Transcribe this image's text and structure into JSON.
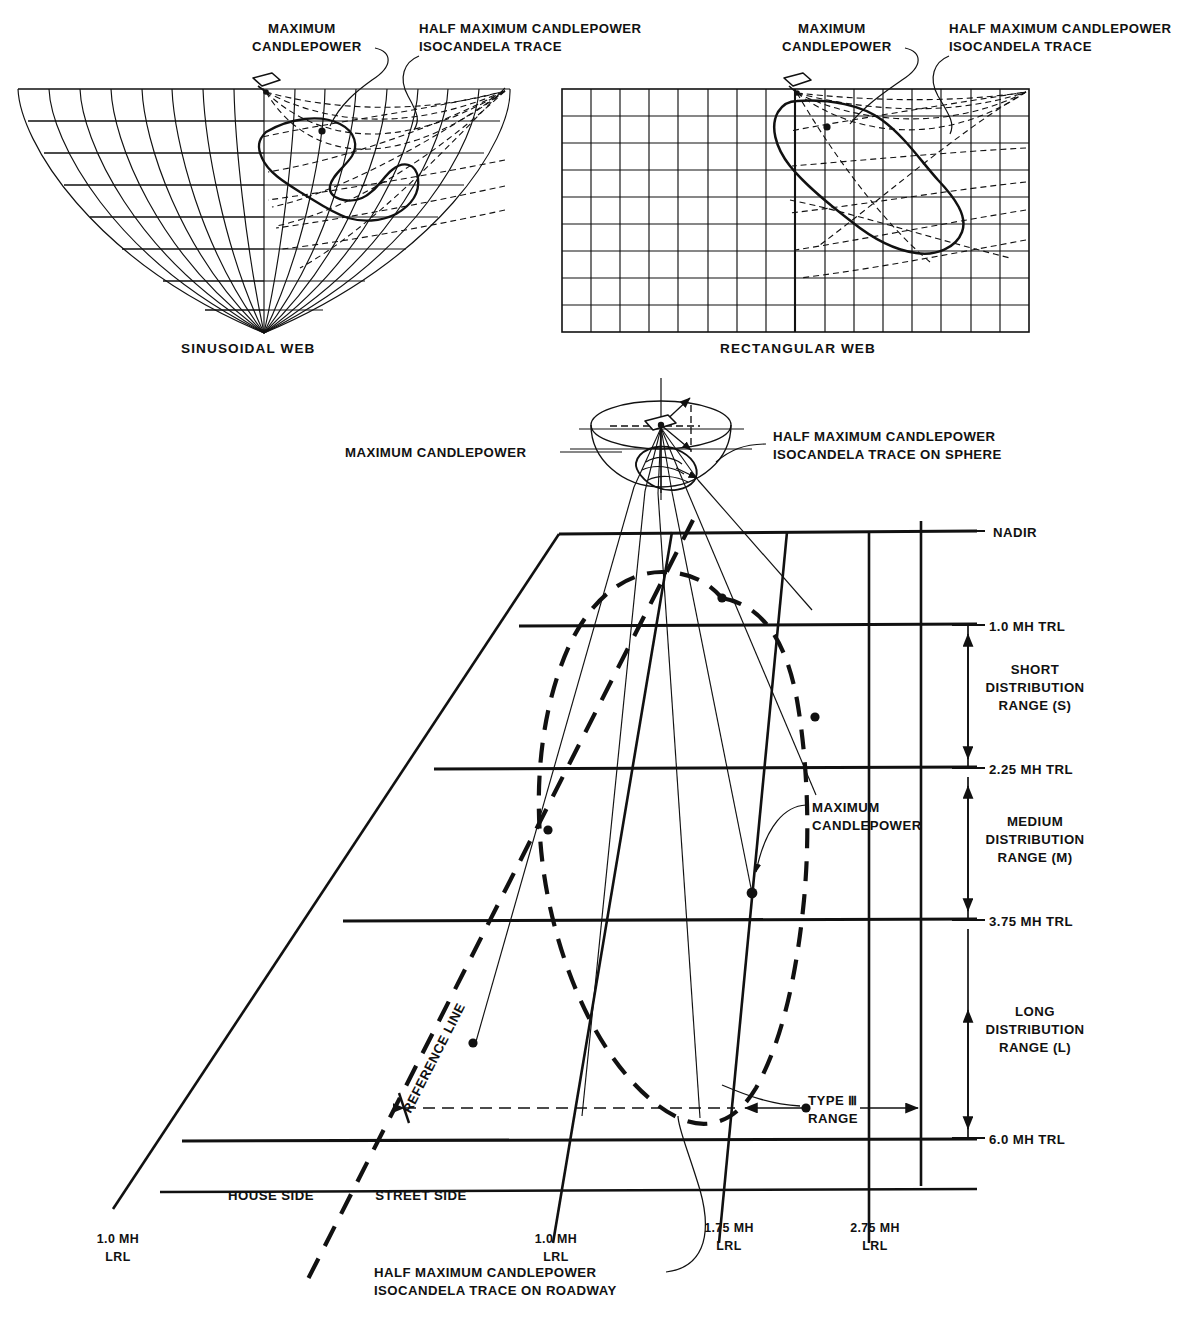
{
  "figure": {
    "title_top_left_web": "SINUSOIDAL WEB",
    "title_top_right_web": "RECTANGULAR WEB"
  },
  "callouts": {
    "max_cp_line1": "MAXIMUM",
    "max_cp_line2": "CANDLEPOWER",
    "half_max_line1": "HALF MAXIMUM CANDLEPOWER",
    "half_max_line2": "ISOCANDELA TRACE",
    "sphere_max_cp": "MAXIMUM CANDLEPOWER",
    "sphere_half_line1": "HALF MAXIMUM CANDLEPOWER",
    "sphere_half_line2": "ISOCANDELA TRACE ON SPHERE",
    "roadway_max_line1": "MAXIMUM",
    "roadway_max_line2": "CANDLEPOWER",
    "roadway_half_line1": "HALF MAXIMUM CANDLEPOWER",
    "roadway_half_line2": "ISOCANDELA TRACE ON ROADWAY",
    "reference_line": "REFERENCE LINE",
    "type_range_line1": "TYPE Ⅲ",
    "type_range_line2": "RANGE"
  },
  "trl_axis": {
    "nadir": "NADIR",
    "ticks": [
      {
        "label": "1.0 MH TRL",
        "value": 1.0
      },
      {
        "label": "2.25 MH TRL",
        "value": 2.25
      },
      {
        "label": "3.75 MH TRL",
        "value": 3.75
      },
      {
        "label": "6.0 MH TRL",
        "value": 6.0
      }
    ]
  },
  "distribution_ranges": [
    {
      "name_line1": "SHORT",
      "name_line2": "DISTRIBUTION",
      "name_line3": "RANGE (S)",
      "code": "S",
      "from": 1.0,
      "to": 2.25
    },
    {
      "name_line1": "MEDIUM",
      "name_line2": "DISTRIBUTION",
      "name_line3": "RANGE (M)",
      "code": "M",
      "from": 2.25,
      "to": 3.75
    },
    {
      "name_line1": "LONG",
      "name_line2": "DISTRIBUTION",
      "name_line3": "RANGE (L)",
      "code": "L",
      "from": 3.75,
      "to": 6.0
    }
  ],
  "roadway": {
    "house_side": "HOUSE SIDE",
    "street_side": "STREET SIDE",
    "lrl_labels": [
      {
        "line1": "1.0 MH",
        "line2": "LRL",
        "value": 1.0,
        "side": "house"
      },
      {
        "line1": "1.0 MH",
        "line2": "LRL",
        "value": 1.0,
        "side": "street"
      },
      {
        "line1": "1.75 MH",
        "line2": "LRL",
        "value": 1.75,
        "side": "street"
      },
      {
        "line1": "2.75 MH",
        "line2": "LRL",
        "value": 2.75,
        "side": "street"
      }
    ]
  },
  "colors": {
    "ink": "#111111",
    "paper": "#ffffff"
  }
}
